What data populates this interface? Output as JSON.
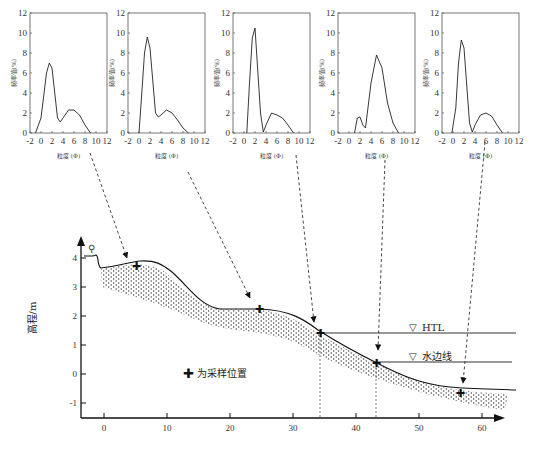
{
  "distribution_charts": {
    "y_label": "频率值(%)",
    "x_label": "粒度 (Φ)",
    "y_ticks": [
      "0",
      "2",
      "4",
      "6",
      "8",
      "10",
      "12"
    ],
    "x_ticks": [
      "-2",
      "0",
      "2",
      "4",
      "6",
      "8",
      "10",
      "12"
    ]
  },
  "profile": {
    "y_label": "高程/m",
    "y_ticks": [
      "-1",
      "0",
      "1",
      "2",
      "3",
      "4"
    ],
    "x_ticks": [
      "0",
      "10",
      "20",
      "30",
      "40",
      "50",
      "60"
    ],
    "htl_label": "HTL",
    "waterline_label": "水边线",
    "legend_label": "为采样位置"
  },
  "chart_data": [
    {
      "type": "line",
      "title": "Sample 1 grain size",
      "xlabel": "粒度 (Φ)",
      "ylabel": "频率值(%)",
      "xlim": [
        -2,
        12
      ],
      "ylim": [
        0,
        12
      ],
      "x": [
        -1,
        0,
        1,
        1.5,
        2,
        3,
        3.5,
        4,
        5,
        6,
        7,
        8,
        9
      ],
      "values": [
        0,
        1.5,
        6,
        7,
        6.5,
        1.5,
        1.1,
        1.5,
        2.3,
        2.3,
        1.8,
        0.8,
        0
      ]
    },
    {
      "type": "line",
      "title": "Sample 2 grain size",
      "xlabel": "粒度 (Φ)",
      "ylabel": "频率值(%)",
      "xlim": [
        -2,
        12
      ],
      "ylim": [
        0,
        12
      ],
      "x": [
        0,
        0.5,
        1,
        1.5,
        2,
        3,
        3.5,
        4,
        5,
        6,
        7,
        8,
        9
      ],
      "values": [
        0,
        4,
        8,
        9.6,
        8.5,
        2,
        1.6,
        1.8,
        2.3,
        2,
        1.3,
        0.5,
        0
      ]
    },
    {
      "type": "line",
      "title": "Sample 3 grain size",
      "xlabel": "粒度 (Φ)",
      "ylabel": "频率值(%)",
      "xlim": [
        -2,
        12
      ],
      "ylim": [
        0,
        12
      ],
      "x": [
        0.5,
        1,
        1.5,
        2,
        3,
        3.5,
        4,
        5,
        6,
        7,
        8,
        9
      ],
      "values": [
        0,
        5,
        9.5,
        10.5,
        2,
        0.1,
        0.8,
        2,
        1.8,
        1.5,
        0.8,
        0
      ]
    },
    {
      "type": "line",
      "title": "Sample 4 grain size",
      "xlabel": "粒度 (Φ)",
      "ylabel": "频率值(%)",
      "xlim": [
        -2,
        12
      ],
      "ylim": [
        0,
        12
      ],
      "x": [
        1,
        1.5,
        2,
        2.5,
        3,
        4,
        5,
        6,
        7,
        8,
        9
      ],
      "values": [
        0,
        1.5,
        1.6,
        0.8,
        0.5,
        5,
        7.8,
        6.5,
        3,
        1,
        0
      ]
    },
    {
      "type": "line",
      "title": "Sample 5 grain size",
      "xlabel": "粒度 (Φ)",
      "ylabel": "频率值(%)",
      "xlim": [
        -2,
        12
      ],
      "ylim": [
        0,
        12
      ],
      "x": [
        -0.2,
        0.5,
        1,
        1.5,
        2,
        3,
        3.5,
        4,
        5,
        6,
        7,
        8,
        9
      ],
      "values": [
        0,
        2.5,
        7,
        9.3,
        8.5,
        1,
        0.1,
        0.8,
        1.8,
        2,
        1.7,
        0.8,
        0
      ]
    }
  ]
}
